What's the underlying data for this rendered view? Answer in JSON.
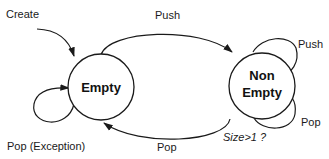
{
  "diagram": {
    "type": "state-machine",
    "colors": {
      "stroke": "#1a1a1a",
      "background": "#ffffff"
    },
    "states": [
      {
        "id": "empty",
        "label": "Empty"
      },
      {
        "id": "non_empty",
        "label_line1": "Non",
        "label_line2": "Empty"
      }
    ],
    "transitions": {
      "create": {
        "label": "Create",
        "from": null,
        "to": "empty"
      },
      "push_empty_to_nonempty": {
        "label": "Push",
        "from": "empty",
        "to": "non_empty"
      },
      "push_self": {
        "label": "Push",
        "from": "non_empty",
        "to": "non_empty"
      },
      "pop_self": {
        "label": "Pop",
        "from": "non_empty",
        "to": "non_empty"
      },
      "pop_nonempty_to_empty": {
        "label": "Pop",
        "from": "non_empty",
        "to": "empty"
      },
      "pop_exception": {
        "label": "Pop (Exception)",
        "from": "empty",
        "to": "empty"
      }
    },
    "guard": {
      "label": "Size>1 ?"
    }
  }
}
